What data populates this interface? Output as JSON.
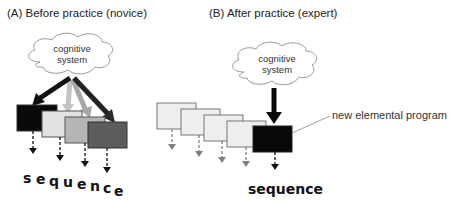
{
  "panel_a": {
    "title": "(A) Before practice (novice)",
    "cloud": {
      "line1": "cognitive",
      "line2": "system"
    },
    "sequence_label_letters": [
      "s",
      "e",
      "q",
      "u",
      "e",
      "n",
      "c",
      "e"
    ],
    "boxes": [
      {
        "fill": "#0a0a0a"
      },
      {
        "fill": "#e2e2e2"
      },
      {
        "fill": "#b5b5b5"
      },
      {
        "fill": "#5c5c5c"
      }
    ],
    "arrows": [
      {
        "color": "#111111",
        "target": "box-1"
      },
      {
        "color": "#c4c4c4",
        "target": "box-2"
      },
      {
        "color": "#a8a8a8",
        "target": "box-3"
      },
      {
        "color": "#2a2a2a",
        "target": "box-4"
      }
    ]
  },
  "panel_b": {
    "title": "(B) After practice (expert)",
    "cloud": {
      "line1": "cognitive",
      "line2": "system"
    },
    "sequence_label": "sequence",
    "annotation": "new elemental program",
    "boxes": [
      {
        "fill": "#eeeeee"
      },
      {
        "fill": "#eeeeee"
      },
      {
        "fill": "#eeeeee"
      },
      {
        "fill": "#eeeeee"
      },
      {
        "fill": "#080808"
      }
    ]
  },
  "colors": {
    "box_stroke": "#555555",
    "faded_arrow": "#808080",
    "dark_arrow": "#111111",
    "cloud_stroke": "#9a9a9a"
  }
}
